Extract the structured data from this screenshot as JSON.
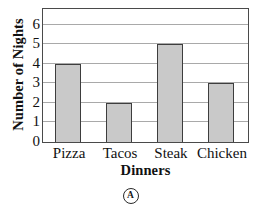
{
  "chart_data": {
    "type": "bar",
    "title": "",
    "xlabel": "Dinners",
    "ylabel": "Number of Nights",
    "categories": [
      "Pizza",
      "Tacos",
      "Steak",
      "Chicken"
    ],
    "values": [
      4,
      2,
      5,
      3
    ],
    "yticks": [
      0,
      1,
      2,
      3,
      4,
      5,
      6
    ],
    "ylim": [
      0,
      6.75
    ],
    "grid": true,
    "legend": "none",
    "bar_fill_color": "#c9c9c9",
    "bar_edge_color": "#3d3d3d",
    "gridline_color": "#a9a9a9",
    "frame_color": "#4a4a4a",
    "background_color": "#ffffff"
  },
  "answer_choice": {
    "label": "A"
  }
}
